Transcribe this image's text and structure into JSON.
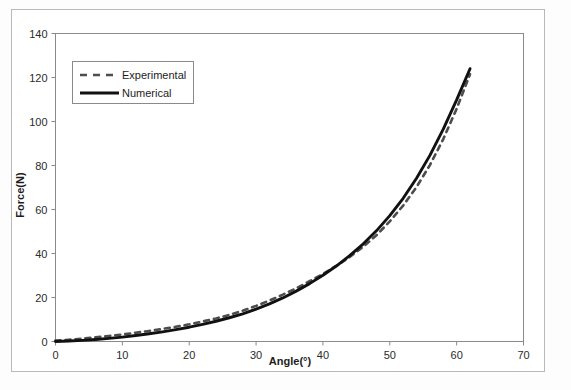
{
  "chart_data": {
    "type": "line",
    "title": "",
    "xlabel": "Angle(°)",
    "ylabel": "Force(N)",
    "xlim": [
      0,
      70
    ],
    "ylim": [
      0,
      140
    ],
    "xticks": [
      0,
      10,
      20,
      30,
      40,
      50,
      60,
      70
    ],
    "yticks": [
      0,
      20,
      40,
      60,
      80,
      100,
      120,
      140
    ],
    "xtick_labels": [
      "0",
      "10",
      "20",
      "30",
      "40",
      "50",
      "60",
      "70"
    ],
    "ytick_labels": [
      "0",
      "20",
      "40",
      "60",
      "80",
      "100",
      "120",
      "140"
    ],
    "grid": false,
    "legend_position": "upper-left-inside",
    "series": [
      {
        "name": "Experimental",
        "style": "dashed",
        "color": "#4d4d4d",
        "x": [
          0,
          2,
          4,
          6,
          8,
          10,
          12,
          14,
          16,
          18,
          20,
          22,
          24,
          26,
          28,
          30,
          32,
          34,
          36,
          38,
          40,
          42,
          44,
          46,
          48,
          50,
          52,
          54,
          56,
          58,
          60,
          62
        ],
        "y": [
          0.4,
          0.8,
          1.3,
          1.9,
          2.5,
          3.2,
          4.0,
          4.8,
          5.7,
          6.7,
          7.8,
          9.1,
          10.5,
          12.1,
          14.0,
          16.2,
          18.6,
          21.3,
          24.2,
          27.4,
          30.7,
          34.4,
          38.4,
          43.0,
          48.3,
          54.6,
          61.8,
          70.2,
          80.2,
          92.0,
          105.8,
          121.5
        ]
      },
      {
        "name": "Numerical",
        "style": "solid",
        "color": "#111111",
        "x": [
          0,
          2,
          4,
          6,
          8,
          10,
          12,
          14,
          16,
          18,
          20,
          22,
          24,
          26,
          28,
          30,
          32,
          34,
          36,
          38,
          40,
          42,
          44,
          46,
          48,
          50,
          52,
          54,
          56,
          58,
          60,
          62
        ],
        "y": [
          0.0,
          0.2,
          0.5,
          0.9,
          1.4,
          2.0,
          2.7,
          3.5,
          4.4,
          5.4,
          6.5,
          7.8,
          9.2,
          10.8,
          12.6,
          14.7,
          17.1,
          19.8,
          22.9,
          26.3,
          30.1,
          34.3,
          39.0,
          44.3,
          50.3,
          57.2,
          65.1,
          74.2,
          84.6,
          96.5,
          109.8,
          124.0
        ]
      }
    ],
    "legend": [
      {
        "label": "Experimental",
        "style": "dashed"
      },
      {
        "label": "Numerical",
        "style": "solid"
      }
    ]
  }
}
